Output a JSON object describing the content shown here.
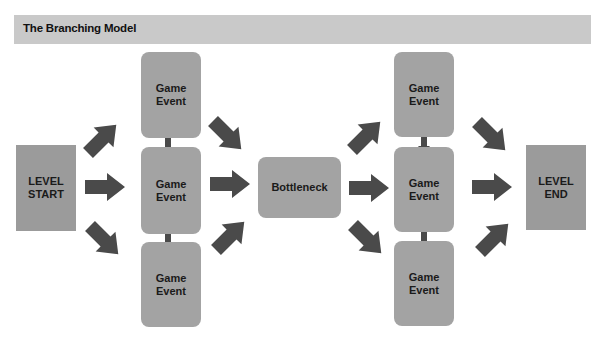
{
  "header": {
    "title": "The Branching Model"
  },
  "colors": {
    "header_bg": "#c9c9c9",
    "node_fill": "#a3a3a3",
    "terminal_fill": "#9b9b9b",
    "arrow": "#4a4a4a"
  },
  "nodes": {
    "level_start": {
      "label": "LEVEL\nSTART"
    },
    "left_top": {
      "label": "Game\nEvent"
    },
    "left_mid": {
      "label": "Game\nEvent"
    },
    "left_bot": {
      "label": "Game\nEvent"
    },
    "bottleneck": {
      "label": "Bottleneck"
    },
    "right_top": {
      "label": "Game\nEvent"
    },
    "right_mid": {
      "label": "Game\nEvent"
    },
    "right_bot": {
      "label": "Game\nEvent"
    },
    "level_end": {
      "label": "LEVEL\nEND"
    }
  },
  "edges": [
    {
      "from": "level_start",
      "to": "left_top"
    },
    {
      "from": "level_start",
      "to": "left_mid"
    },
    {
      "from": "level_start",
      "to": "left_bot"
    },
    {
      "from": "left_top",
      "to": "left_mid",
      "bidirectional": true
    },
    {
      "from": "left_mid",
      "to": "left_bot",
      "bidirectional": true
    },
    {
      "from": "left_top",
      "to": "bottleneck"
    },
    {
      "from": "left_mid",
      "to": "bottleneck"
    },
    {
      "from": "left_bot",
      "to": "bottleneck"
    },
    {
      "from": "bottleneck",
      "to": "right_top"
    },
    {
      "from": "bottleneck",
      "to": "right_mid"
    },
    {
      "from": "bottleneck",
      "to": "right_bot"
    },
    {
      "from": "right_top",
      "to": "right_mid",
      "bidirectional": true
    },
    {
      "from": "right_mid",
      "to": "right_bot",
      "bidirectional": true
    },
    {
      "from": "right_top",
      "to": "level_end"
    },
    {
      "from": "right_mid",
      "to": "level_end"
    },
    {
      "from": "right_bot",
      "to": "level_end"
    }
  ]
}
